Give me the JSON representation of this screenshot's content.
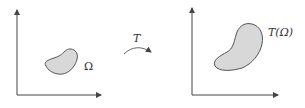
{
  "diagram": {
    "left_panel": {
      "region_label": "Ω"
    },
    "mapping": {
      "label": "T"
    },
    "right_panel": {
      "region_label": "T(Ω)"
    },
    "colors": {
      "axis": "#444444",
      "region_fill": "#d8d8d8",
      "region_stroke": "#555555",
      "arrow": "#555555"
    }
  }
}
